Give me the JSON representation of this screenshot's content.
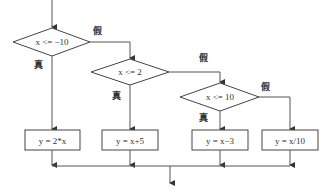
{
  "flowchart": {
    "decisions": [
      {
        "id": "d1",
        "label": "x <= −10",
        "true_label": "真",
        "false_label": "假"
      },
      {
        "id": "d2",
        "label": "x <= 2",
        "true_label": "真",
        "false_label": "假"
      },
      {
        "id": "d3",
        "label": "x <= 10",
        "true_label": "真",
        "false_label": "假"
      }
    ],
    "processes": [
      {
        "id": "p1",
        "label": "y = 2*x"
      },
      {
        "id": "p2",
        "label": "y = x+5"
      },
      {
        "id": "p3",
        "label": "y = x−3"
      },
      {
        "id": "p4",
        "label": "y = x/10"
      }
    ]
  }
}
